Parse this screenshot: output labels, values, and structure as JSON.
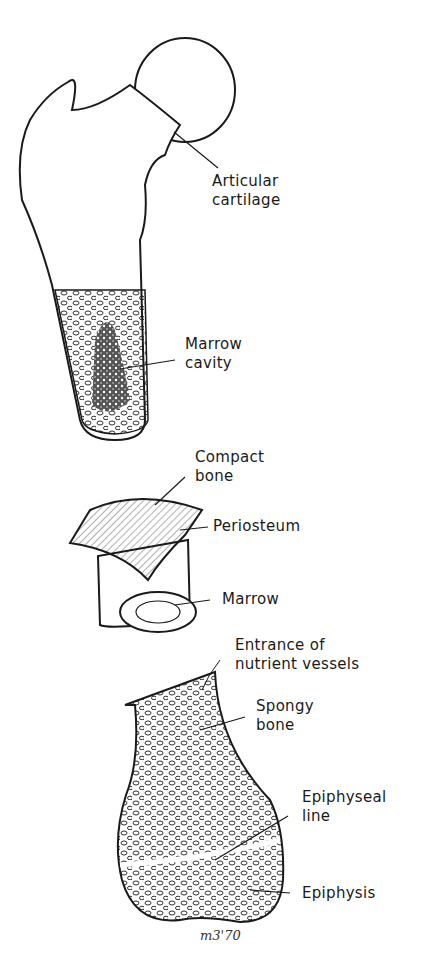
{
  "diagram": {
    "views": [
      "proximal-femur-cross-section",
      "shaft-segment",
      "distal-femur-section"
    ],
    "labels": {
      "articular_cartilage": "Articular\ncartilage",
      "marrow_cavity": "Marrow\ncavity",
      "compact_bone": "Compact\nbone",
      "periosteum": "Periosteum",
      "marrow": "Marrow",
      "nutrient_vessels": "Entrance of\nnutrient vessels",
      "spongy_bone": "Spongy\nbone",
      "epiphyseal_line": "Epiphyseal\nline",
      "epiphysis": "Epiphysis"
    },
    "signature": "m3'70"
  },
  "colors": {
    "ink": "#1a1a1a",
    "background": "#ffffff",
    "marrow_dark": "#3a3a3a"
  }
}
